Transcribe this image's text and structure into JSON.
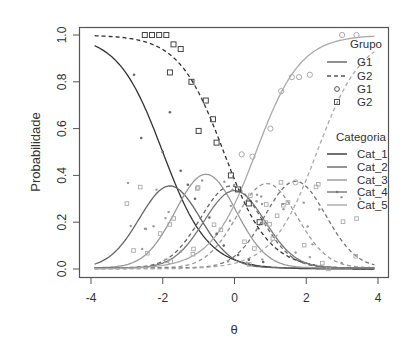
{
  "chart_data": {
    "type": "line",
    "title": "",
    "xlabel": "θ",
    "ylabel": "Probabilidade",
    "xlim": [
      -4,
      4
    ],
    "ylim": [
      0,
      1
    ],
    "xticks": [
      "-4",
      "-2",
      "0",
      "2",
      "4"
    ],
    "yticks": [
      "0.0",
      "0.2",
      "0.4",
      "0.6",
      "0.8",
      "1.0"
    ],
    "grid": false,
    "legend_position": "right-inside",
    "legends": [
      {
        "title": "Grupo",
        "entries": [
          {
            "label": "G1",
            "symbol": "solid-line"
          },
          {
            "label": "G2",
            "symbol": "dashed-line"
          },
          {
            "label": "G1",
            "symbol": "circle"
          },
          {
            "label": "G2",
            "symbol": "square"
          }
        ]
      },
      {
        "title": "Categoria",
        "entries": [
          {
            "label": "Cat_1",
            "color": "#333333"
          },
          {
            "label": "Cat_2",
            "color": "#666666"
          },
          {
            "label": "Cat_3",
            "color": "#999999"
          },
          {
            "label": "Cat_4",
            "color": "#777777"
          },
          {
            "label": "Cat_5",
            "color": "#aaaaaa"
          }
        ]
      }
    ],
    "series": [
      {
        "name": "Cat_1 G1",
        "group": "G1",
        "category": "Cat_1",
        "style": "solid",
        "color": "#333333",
        "shape": "decreasing",
        "b": -2.0,
        "a": 1.6
      },
      {
        "name": "Cat_1 G2",
        "group": "G2",
        "category": "Cat_1",
        "style": "dashed",
        "color": "#333333",
        "shape": "decreasing",
        "b": -0.3,
        "a": 1.6
      },
      {
        "name": "Cat_2 G1",
        "group": "G1",
        "category": "Cat_2",
        "style": "solid",
        "color": "#666666",
        "shape": "bell",
        "peak_x": -1.8,
        "peak_y": 0.35
      },
      {
        "name": "Cat_2 G2",
        "group": "G2",
        "category": "Cat_2",
        "style": "dashed",
        "color": "#666666",
        "shape": "bell",
        "peak_x": -0.1,
        "peak_y": 0.35
      },
      {
        "name": "Cat_3 G1",
        "group": "G1",
        "category": "Cat_3",
        "style": "solid",
        "color": "#999999",
        "shape": "bell",
        "peak_x": -0.8,
        "peak_y": 0.4
      },
      {
        "name": "Cat_3 G2",
        "group": "G2",
        "category": "Cat_3",
        "style": "dashed",
        "color": "#999999",
        "shape": "bell",
        "peak_x": 0.9,
        "peak_y": 0.36
      },
      {
        "name": "Cat_4 G1",
        "group": "G1",
        "category": "Cat_4",
        "style": "solid",
        "color": "#777777",
        "shape": "bell",
        "peak_x": 0.0,
        "peak_y": 0.33
      },
      {
        "name": "Cat_4 G2",
        "group": "G2",
        "category": "Cat_4",
        "style": "dashed",
        "color": "#777777",
        "shape": "bell",
        "peak_x": 1.7,
        "peak_y": 0.37
      },
      {
        "name": "Cat_5 G1",
        "group": "G1",
        "category": "Cat_5",
        "style": "solid",
        "color": "#aaaaaa",
        "shape": "increasing",
        "b": 0.6,
        "a": 1.6
      },
      {
        "name": "Cat_5 G2",
        "group": "G2",
        "category": "Cat_5",
        "style": "dashed",
        "color": "#aaaaaa",
        "shape": "increasing",
        "b": 2.3,
        "a": 1.6
      }
    ],
    "observed_points": {
      "G2_cat1_squares": [
        [
          -2.5,
          1.0
        ],
        [
          -2.3,
          1.0
        ],
        [
          -2.1,
          1.0
        ],
        [
          -1.9,
          1.0
        ],
        [
          -1.7,
          0.96
        ],
        [
          -1.5,
          0.94
        ],
        [
          -1.8,
          0.84
        ],
        [
          -1.2,
          0.8
        ],
        [
          -0.8,
          0.72
        ],
        [
          -0.6,
          0.64
        ],
        [
          -1.0,
          0.59
        ],
        [
          -0.5,
          0.54
        ],
        [
          -0.1,
          0.4
        ],
        [
          0.1,
          0.34
        ],
        [
          0.4,
          0.28
        ],
        [
          0.7,
          0.2
        ]
      ],
      "G1_cat5_circles": [
        [
          3.4,
          1.0
        ],
        [
          3.0,
          1.0
        ],
        [
          1.6,
          0.82
        ],
        [
          1.8,
          0.82
        ],
        [
          2.1,
          0.83
        ],
        [
          1.3,
          0.76
        ],
        [
          1.0,
          0.6
        ],
        [
          0.2,
          0.49
        ],
        [
          0.5,
          0.48
        ],
        [
          1.7,
          0.37
        ]
      ],
      "G1_cat1_points": [
        [
          -2.8,
          0.83
        ],
        [
          -1.8,
          0.67
        ],
        [
          -2.6,
          0.56
        ],
        [
          -2.0,
          0.5
        ],
        [
          -1.5,
          0.42
        ],
        [
          -1.3,
          0.36
        ],
        [
          -1.1,
          0.3
        ],
        [
          -0.7,
          0.22
        ],
        [
          -0.5,
          0.15
        ],
        [
          -0.3,
          0.1
        ],
        [
          0.1,
          0.06
        ],
        [
          0.4,
          0.04
        ],
        [
          0.8,
          0.03
        ]
      ]
    }
  }
}
